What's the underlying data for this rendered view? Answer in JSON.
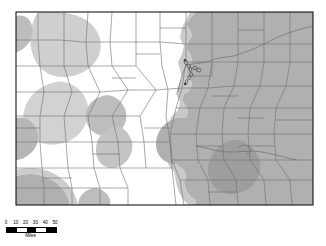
{
  "figure": {
    "type": "thematic-county-map",
    "region": "Colorado",
    "background_color": "#ffffff",
    "border_color": "#000000",
    "county_line_color": "#6e6e6e",
    "shaded_fill_color": "#b0b0b0",
    "unshaded_fill_color": "#ffffff",
    "marker_color": "#4a4a4a",
    "map_frame": {
      "x": 16,
      "y": 12,
      "width": 297,
      "height": 193
    }
  },
  "scale": {
    "units_label": "Miles",
    "tick_labels": [
      "0",
      "10",
      "20",
      "30",
      "40",
      "50"
    ],
    "tick_positions_pct": [
      0,
      20,
      40,
      60,
      80,
      100
    ],
    "segment_count": 5,
    "segment_pattern": [
      "on",
      "off",
      "on",
      "off",
      "on"
    ]
  },
  "legend": {
    "shaded_meaning": "shaded area",
    "marker_meaning": "point location"
  },
  "markers": [
    {
      "x": 186.0,
      "y": 62.5,
      "rx": 1.6,
      "ry": 2.4,
      "rot": -25
    },
    {
      "x": 188.6,
      "y": 66.0,
      "rx": 1.5,
      "ry": 2.2,
      "rot": -20
    },
    {
      "x": 190.5,
      "y": 69.5,
      "rx": 1.4,
      "ry": 2.0,
      "rot": -15
    },
    {
      "x": 195.0,
      "y": 68.0,
      "rx": 2.1,
      "ry": 1.6,
      "rot": 10
    },
    {
      "x": 198.8,
      "y": 70.2,
      "rx": 2.3,
      "ry": 1.7,
      "rot": 5
    },
    {
      "x": 191.2,
      "y": 74.5,
      "rx": 1.5,
      "ry": 2.0,
      "rot": -10
    },
    {
      "x": 189.0,
      "y": 78.0,
      "rx": 1.4,
      "ry": 1.8,
      "rot": -5
    },
    {
      "x": 186.5,
      "y": 81.5,
      "rx": 1.3,
      "ry": 1.7,
      "rot": 0
    }
  ],
  "shaded_regions": [
    {
      "name": "eastern-plains"
    },
    {
      "name": "northwest-blob"
    },
    {
      "name": "west-central-band"
    },
    {
      "name": "southwest-corner"
    },
    {
      "name": "south-central-blob"
    },
    {
      "name": "southeast-inner-blob"
    }
  ]
}
